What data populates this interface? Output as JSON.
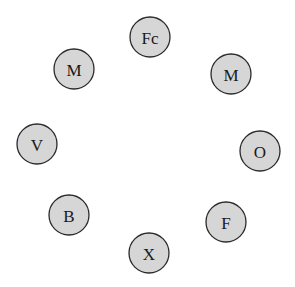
{
  "diagram": {
    "type": "circular-node-arrangement",
    "node_fill": "#d6d6d6",
    "node_stroke": "#2a2a2a",
    "background": "#ffffff",
    "nodes": [
      {
        "label": "Fc",
        "cx": 150,
        "cy": 37,
        "r": 20
      },
      {
        "label": "M",
        "cx": 74,
        "cy": 69,
        "r": 20
      },
      {
        "label": "M",
        "cx": 231,
        "cy": 74,
        "r": 20
      },
      {
        "label": "V",
        "cx": 37,
        "cy": 144,
        "r": 20
      },
      {
        "label": "O",
        "cx": 260,
        "cy": 151,
        "r": 20
      },
      {
        "label": "B",
        "cx": 69,
        "cy": 215,
        "r": 20
      },
      {
        "label": "F",
        "cx": 226,
        "cy": 222,
        "r": 20
      },
      {
        "label": "X",
        "cx": 149,
        "cy": 253,
        "r": 20
      }
    ]
  }
}
